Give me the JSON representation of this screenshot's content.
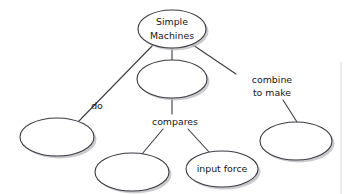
{
  "diagram": {
    "type": "concept-map",
    "background_color": "#ffffff",
    "node_fill": "#ffffff",
    "node_stroke": "#3b3b42",
    "shadow_color": "#b9b9bd",
    "text_color": "#17171a",
    "nodes": [
      {
        "id": "simple-machines",
        "label_line1": "Simple",
        "label_line2": "Machines",
        "filled": true,
        "cx": 172,
        "cy": 29,
        "rx": 34,
        "ry": 19
      },
      {
        "id": "blank-center",
        "label_line1": "",
        "label_line2": "",
        "filled": false,
        "cx": 172,
        "cy": 79,
        "rx": 35,
        "ry": 19
      },
      {
        "id": "blank-left",
        "label_line1": "",
        "label_line2": "",
        "filled": false,
        "cx": 57,
        "cy": 137,
        "rx": 37,
        "ry": 19
      },
      {
        "id": "blank-bottom-center",
        "label_line1": "",
        "label_line2": "",
        "filled": false,
        "cx": 132,
        "cy": 172,
        "rx": 37,
        "ry": 19
      },
      {
        "id": "input-force",
        "label_line1": "input force",
        "label_line2": "",
        "filled": true,
        "cx": 222,
        "cy": 169,
        "rx": 36,
        "ry": 18
      },
      {
        "id": "blank-right",
        "label_line1": "",
        "label_line2": "",
        "filled": false,
        "cx": 296,
        "cy": 141,
        "rx": 36,
        "ry": 19
      }
    ],
    "link_labels": [
      {
        "id": "do",
        "text": "do",
        "line1": "do",
        "line2": "",
        "x": 97,
        "y": 106
      },
      {
        "id": "compares",
        "text": "compares",
        "line1": "compares",
        "line2": "",
        "x": 175,
        "y": 122
      },
      {
        "id": "combine-to-make",
        "text": "combine to make",
        "line1": "combine",
        "line2": "to make",
        "x": 272,
        "y": 86
      }
    ],
    "edges": [
      {
        "id": "edge-simple-to-left",
        "from": "simple-machines",
        "to": "blank-left",
        "label": "do"
      },
      {
        "id": "edge-simple-to-center",
        "from": "simple-machines",
        "to": "blank-center",
        "label": ""
      },
      {
        "id": "edge-simple-to-right",
        "from": "simple-machines",
        "to": "blank-right",
        "label": "combine to make"
      },
      {
        "id": "edge-center-to-bottom-center",
        "from": "blank-center",
        "to": "blank-bottom-center",
        "label": "compares"
      },
      {
        "id": "edge-center-to-input-force",
        "from": "blank-center",
        "to": "input-force",
        "label": "compares"
      }
    ]
  }
}
